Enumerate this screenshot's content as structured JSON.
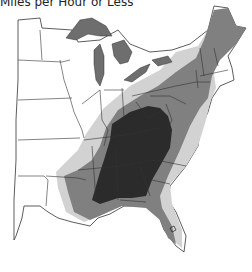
{
  "title": "Miles per Hour or Less",
  "map": {
    "region": "Eastern United States",
    "zones": [
      {
        "name": "zone-1",
        "color": "#ffffff"
      },
      {
        "name": "zone-2",
        "color": "#d2d2d2"
      },
      {
        "name": "zone-3",
        "color": "#808080"
      },
      {
        "name": "zone-4",
        "color": "#2b2b2b"
      }
    ],
    "border_color": "#333333",
    "lakes_color": "#6e6e6e"
  }
}
